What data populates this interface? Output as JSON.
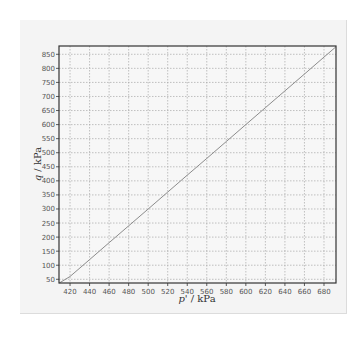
{
  "chart_data": {
    "type": "line",
    "title": "",
    "xlabel": "p' / kPa",
    "ylabel": "q / kPa",
    "xlabel_parts": {
      "symbol": "p'",
      "unit": " / kPa"
    },
    "ylabel_parts": {
      "symbol": "q",
      "unit": " / kPa"
    },
    "xlim": [
      408.7,
      692.3
    ],
    "ylim": [
      36.8,
      879.5
    ],
    "x_ticks": [
      420,
      440,
      460,
      480,
      500,
      520,
      540,
      560,
      580,
      600,
      620,
      640,
      660,
      680
    ],
    "y_ticks": [
      50,
      100,
      150,
      200,
      250,
      300,
      350,
      400,
      450,
      500,
      550,
      600,
      650,
      700,
      750,
      800,
      850
    ],
    "grid": true,
    "grid_style": "dotted",
    "legend": null,
    "series": [
      {
        "name": "stress path",
        "color": "#8c8c8c",
        "x": [
          409,
          420,
          440,
          460,
          480,
          500,
          520,
          540,
          560,
          580,
          600,
          620,
          640,
          660,
          680,
          692
        ],
        "y": [
          27,
          60,
          120,
          180,
          240,
          300,
          360,
          420,
          480,
          540,
          600,
          660,
          720,
          780,
          840,
          876
        ]
      }
    ]
  },
  "colors": {
    "panel_bg": "#f4f4f4",
    "plot_bg": "#f7f7f7",
    "frame": "#333333",
    "grid": "#a8a8a8",
    "line": "#8c8c8c"
  }
}
